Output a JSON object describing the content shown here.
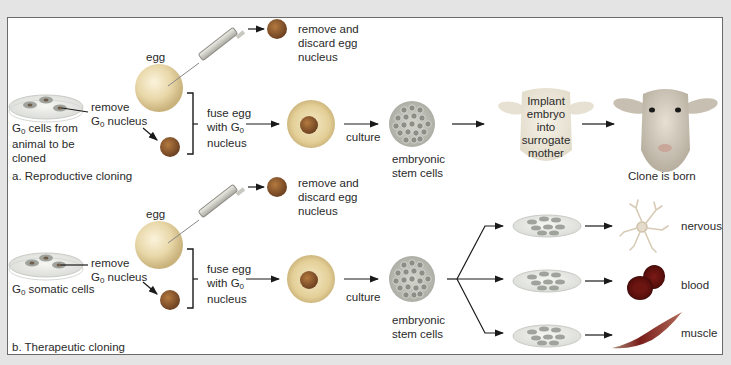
{
  "figure": {
    "background_color": "#e4e4e4",
    "panel_color": "#ffffff",
    "border_color": "#6a6a6a"
  },
  "reproductive": {
    "title": "a. Reproductive cloning",
    "source_cells": [
      "G",
      "0",
      " cells from",
      "animal to be",
      "cloned"
    ],
    "source_line1_rest": " cells from",
    "source_line2": "animal to be",
    "source_line3": "cloned",
    "egg_label": "egg",
    "remove_line1": "remove",
    "remove_line2_rest": " nucleus",
    "discard_line1": "remove and",
    "discard_line2": "discard egg",
    "discard_line3": "nucleus",
    "fuse_line1": "fuse egg",
    "fuse_line2": "with G",
    "fuse_line3": "nucleus",
    "culture_label": "culture",
    "stem_line1": "embryonic",
    "stem_line2": "stem cells",
    "implant_line1": "Implant",
    "implant_line2": "embryo",
    "implant_line3": "into",
    "implant_line4": "surrogate",
    "implant_line5": "mother",
    "result_label": "Clone is born"
  },
  "therapeutic": {
    "title": "b. Therapeutic cloning",
    "source_rest": " somatic cells",
    "egg_label": "egg",
    "remove_line1": "remove",
    "remove_line2_rest": " nucleus",
    "discard_line1": "remove and",
    "discard_line2": "discard egg",
    "discard_line3": "nucleus",
    "fuse_line1": "fuse egg",
    "fuse_line2": "with G",
    "fuse_line3": "nucleus",
    "culture_label": "culture",
    "stem_line1": "embryonic",
    "stem_line2": "stem cells",
    "outcomes": [
      {
        "label": "nervous",
        "icon": "nerve-cell-icon"
      },
      {
        "label": "blood",
        "icon": "blood-cell-icon"
      },
      {
        "label": "muscle",
        "icon": "muscle-cell-icon"
      }
    ]
  },
  "symbols": {
    "g": "G",
    "zero": "0"
  }
}
